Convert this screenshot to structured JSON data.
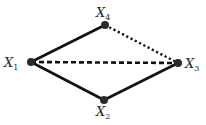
{
  "diagram": {
    "type": "graph",
    "colors": {
      "node": "#2b2b2b",
      "edge": "#111111",
      "label": "#2a2a2a",
      "background": "#ffffff"
    },
    "nodes": [
      {
        "id": "X1",
        "base": "X",
        "sub": "1",
        "x": 31,
        "y": 62
      },
      {
        "id": "X2",
        "base": "X",
        "sub": "2",
        "x": 104,
        "y": 100
      },
      {
        "id": "X3",
        "base": "X",
        "sub": "3",
        "x": 178,
        "y": 63
      },
      {
        "id": "X4",
        "base": "X",
        "sub": "4",
        "x": 105,
        "y": 25
      }
    ],
    "edges": [
      {
        "from": "X1",
        "to": "X4",
        "style": "solid"
      },
      {
        "from": "X1",
        "to": "X2",
        "style": "solid"
      },
      {
        "from": "X2",
        "to": "X3",
        "style": "solid"
      },
      {
        "from": "X1",
        "to": "X3",
        "style": "dashed"
      },
      {
        "from": "X4",
        "to": "X3",
        "style": "dotted"
      }
    ],
    "labels": {
      "x1": {
        "base": "X",
        "sub": "1"
      },
      "x2": {
        "base": "X",
        "sub": "2"
      },
      "x3": {
        "base": "X",
        "sub": "3"
      },
      "x4": {
        "base": "X",
        "sub": "4"
      }
    }
  }
}
